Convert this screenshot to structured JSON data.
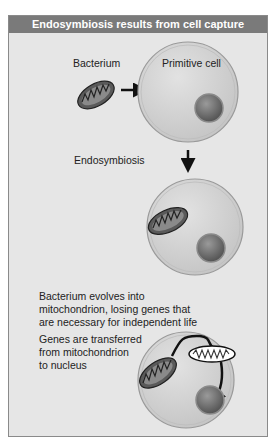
{
  "title": "Endosymbiosis results from cell capture",
  "labels": {
    "bacterium": "Bacterium",
    "primitive_cell": "Primitive cell",
    "endosymbiosis": "Endosymbiosis",
    "evolves_line1": "Bacterium evolves into",
    "evolves_line2": "mitochondrion, losing genes that",
    "evolves_line3": "are necessary for independent life",
    "transfer_line1": "Genes are transferred",
    "transfer_line2": "from mitochondrion",
    "transfer_line3": "to nucleus"
  },
  "colors": {
    "panel_bg": "#e6e6e6",
    "title_bg": "#7a7a7a",
    "title_text": "#ffffff",
    "cell_fill": "#d4d4d4",
    "cell_outline": "#9a9a9a",
    "nucleus_fill": "#6e6e6e",
    "mitochondrion_fill": "#5a5a5a"
  }
}
